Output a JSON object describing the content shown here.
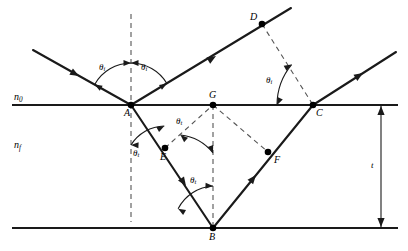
{
  "figure": {
    "type": "optics-ray-diagram",
    "width": 408,
    "height": 251,
    "background_color": "#ffffff",
    "line_color": "#1a1a1a",
    "dash_color": "#555555"
  },
  "media": {
    "upper": {
      "symbol": "n",
      "subscript": "0",
      "x": 14,
      "y": 92
    },
    "lower": {
      "symbol": "n",
      "subscript": "f",
      "x": 14,
      "y": 140
    }
  },
  "dimension": {
    "label": "t",
    "x": 371,
    "y": 161,
    "from_y": 105,
    "to_y": 228,
    "at_x": 381
  },
  "points": [
    {
      "id": "A",
      "label": "A",
      "x": 131,
      "y": 105,
      "lx": 124,
      "ly": 108,
      "dot": true
    },
    {
      "id": "B",
      "label": "B",
      "x": 213,
      "y": 228,
      "lx": 209,
      "ly": 232,
      "dot": true
    },
    {
      "id": "C",
      "label": "C",
      "x": 313,
      "y": 105,
      "lx": 316,
      "ly": 108,
      "dot": true
    },
    {
      "id": "D",
      "label": "D",
      "x": 262,
      "y": 24,
      "lx": 250,
      "ly": 12,
      "dot": true
    },
    {
      "id": "E",
      "label": "E",
      "x": 165,
      "y": 148,
      "lx": 160,
      "ly": 152,
      "dot": true
    },
    {
      "id": "F",
      "label": "F",
      "x": 268,
      "y": 152,
      "lx": 274,
      "ly": 155,
      "dot": true
    },
    {
      "id": "G",
      "label": "G",
      "x": 213,
      "y": 105,
      "lx": 209,
      "ly": 90,
      "dot": true
    }
  ],
  "angles": [
    {
      "id": "theta-i-incident",
      "symbol": "θ",
      "subscript": "i",
      "x": 99,
      "y": 63
    },
    {
      "id": "theta-i-reflected",
      "symbol": "θ",
      "subscript": "i",
      "x": 141,
      "y": 63
    },
    {
      "id": "theta-i-at-C",
      "symbol": "θ",
      "subscript": "i",
      "x": 266,
      "y": 76
    },
    {
      "id": "theta-t-at-A",
      "symbol": "θ",
      "subscript": "t",
      "x": 133,
      "y": 149
    },
    {
      "id": "theta-t-at-G",
      "symbol": "θ",
      "subscript": "t",
      "x": 176,
      "y": 117
    },
    {
      "id": "theta-t-at-B",
      "symbol": "θ",
      "subscript": "t",
      "x": 190,
      "y": 176
    }
  ],
  "rays": {
    "incident": {
      "from": [
        33,
        50
      ],
      "to": [
        131,
        105
      ]
    },
    "reflected_at_A": {
      "from": [
        131,
        105
      ],
      "to": [
        291,
        8
      ]
    },
    "refracted_A_to_B": {
      "from": [
        131,
        105
      ],
      "to": [
        213,
        228
      ]
    },
    "reflected_B_to_C": {
      "from": [
        213,
        228
      ],
      "to": [
        313,
        105
      ]
    },
    "transmitted_at_C": {
      "from": [
        313,
        105
      ],
      "to": [
        396,
        52
      ]
    }
  },
  "boundaries": {
    "top": {
      "x1": 12,
      "y": 105,
      "x2": 398
    },
    "bottom": {
      "x1": 12,
      "y": 228,
      "x2": 398
    }
  },
  "construction_lines": [
    {
      "id": "normal-at-A",
      "from": [
        131,
        14
      ],
      "to": [
        131,
        222
      ]
    },
    {
      "id": "normal-at-B",
      "from": [
        213,
        105
      ],
      "to": [
        213,
        228
      ]
    },
    {
      "id": "wavefront-D-to-C",
      "from": [
        262,
        24
      ],
      "to": [
        313,
        105
      ]
    },
    {
      "id": "wavefront-E-to-G",
      "from": [
        165,
        148
      ],
      "to": [
        213,
        105
      ]
    },
    {
      "id": "wavefront-G-to-F",
      "from": [
        213,
        105
      ],
      "to": [
        268,
        152
      ]
    }
  ]
}
